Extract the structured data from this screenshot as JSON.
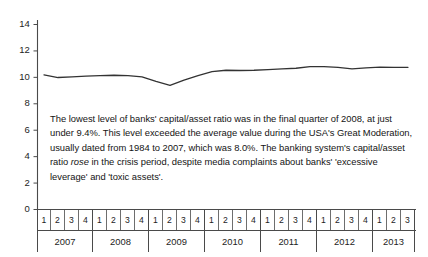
{
  "chart_data": {
    "type": "line",
    "title": "",
    "xlabel": "",
    "ylabel": "",
    "ylim": [
      0,
      14
    ],
    "yticks": [
      0,
      2,
      4,
      6,
      8,
      10,
      12,
      14
    ],
    "grid": false,
    "legend": null,
    "series": [
      {
        "name": "Banks' capital/asset ratio (%)",
        "values": [
          10.15,
          9.95,
          10.0,
          10.05,
          10.1,
          10.12,
          10.1,
          10.0,
          9.65,
          9.35,
          9.75,
          10.1,
          10.4,
          10.5,
          10.48,
          10.5,
          10.55,
          10.6,
          10.65,
          10.78,
          10.78,
          10.72,
          10.6,
          10.68,
          10.74,
          10.72,
          10.72
        ]
      }
    ],
    "x": [
      "2007 Q1",
      "2007 Q2",
      "2007 Q3",
      "2007 Q4",
      "2008 Q1",
      "2008 Q2",
      "2008 Q3",
      "2008 Q4",
      "2009 Q1",
      "2009 Q2",
      "2009 Q3",
      "2009 Q4",
      "2010 Q1",
      "2010 Q2",
      "2010 Q3",
      "2010 Q4",
      "2011 Q1",
      "2011 Q2",
      "2011 Q3",
      "2011 Q4",
      "2012 Q1",
      "2012 Q2",
      "2012 Q3",
      "2012 Q4",
      "2013 Q1",
      "2013 Q2",
      "2013 Q3"
    ],
    "years": [
      {
        "year": "2007",
        "quarters": [
          "1",
          "2",
          "3",
          "4"
        ]
      },
      {
        "year": "2008",
        "quarters": [
          "1",
          "2",
          "3",
          "4"
        ]
      },
      {
        "year": "2009",
        "quarters": [
          "1",
          "2",
          "3",
          "4"
        ]
      },
      {
        "year": "2010",
        "quarters": [
          "1",
          "2",
          "3",
          "4"
        ]
      },
      {
        "year": "2011",
        "quarters": [
          "1",
          "2",
          "3",
          "4"
        ]
      },
      {
        "year": "2012",
        "quarters": [
          "1",
          "2",
          "3",
          "4"
        ]
      },
      {
        "year": "2013",
        "quarters": [
          "1",
          "2",
          "3"
        ]
      }
    ],
    "line_color": "#333333"
  },
  "annotation": {
    "part1": "The lowest level of banks' capital/asset ratio was in the final quarter of 2008, at just under 9.4%. This level exceeded the average value during the USA's Great Moderation, usually dated from 1984 to 2007, which was 8.0%. The banking system's capital/asset ratio ",
    "emphasis": "rose",
    "part2": " in the crisis period, despite media complaints about banks' 'excessive leverage' and 'toxic assets'."
  }
}
